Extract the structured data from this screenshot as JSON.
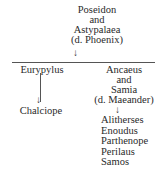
{
  "tree": {
    "root": {
      "lines": [
        "Poseidon",
        "and",
        "Astypalaea",
        "(d. Phoenix)"
      ]
    },
    "children": [
      {
        "name": "Eurypylus",
        "descendants": [
          "Chalciope"
        ]
      },
      {
        "lines": [
          "Ancaeus",
          "and",
          "Samia",
          "(d. Maeander)"
        ],
        "descendants": [
          "Alitherses",
          "Enoudus",
          "Parthenope",
          "Perilaus",
          "Samos"
        ]
      }
    ]
  },
  "symbols": {
    "arrow_down": "↓"
  }
}
